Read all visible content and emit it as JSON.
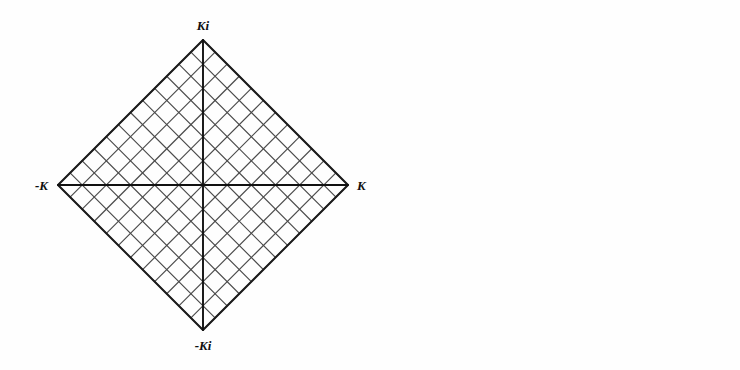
{
  "figure": {
    "background_color": "#fefefe",
    "ink_color": "#1c1c1c",
    "grid_color": "#4a4a4a"
  },
  "panels": [
    {
      "id": "square",
      "name": "square-domain",
      "shape": "square-rotated-45",
      "center": {
        "x": 203,
        "y": 185
      },
      "half_diagonal": 145,
      "grid_divisions_per_half_axis": 6,
      "grid_total_cells": "12 x 12",
      "labels": {
        "right": {
          "text": "K",
          "x": 357,
          "y": 190,
          "anchor": "start",
          "style": "italic"
        },
        "left": {
          "text": "-K",
          "x": 48,
          "y": 190,
          "anchor": "end",
          "style": "italic"
        },
        "top": {
          "text": "Ki",
          "x": 203,
          "y": 30,
          "anchor": "middle",
          "style": "italic"
        },
        "bottom": {
          "text": "-Ki",
          "x": 203,
          "y": 350,
          "anchor": "middle",
          "style": "italic"
        }
      }
    },
    {
      "id": "disk",
      "name": "disk-image",
      "shape": "circle",
      "center": {
        "x": 194,
        "y": 188
      },
      "radius": 134,
      "grid_divisions_per_half_axis": 6,
      "labels": {
        "right": {
          "text": "1",
          "x": 336,
          "y": 193,
          "anchor": "start",
          "style": "upright"
        },
        "left": {
          "text": "-1",
          "x": 52,
          "y": 193,
          "anchor": "end",
          "style": "upright"
        },
        "top": {
          "text": "i",
          "x": 194,
          "y": 36,
          "anchor": "middle",
          "style": "italic"
        },
        "bottom": {
          "text": "-i",
          "x": 194,
          "y": 350,
          "anchor": "middle",
          "style": "italic"
        }
      }
    }
  ],
  "chart_data": {
    "type": "line",
    "mapping": "w -> sn(w, k) with modulus k = 1/sqrt(2) (lemniscatic case)",
    "xlabel": "",
    "ylabel": "",
    "grid": true,
    "legend": false,
    "series": [
      {
        "name": "square-boundary",
        "panel": "square",
        "points": [
          [
            1,
            0
          ],
          [
            0,
            1
          ],
          [
            -1,
            0
          ],
          [
            0,
            -1
          ],
          [
            1,
            0
          ]
        ],
        "note": "unit-scaled diamond vertices at K, Ki, -K, -Ki"
      },
      {
        "name": "square-grid-u-lines",
        "panel": "square",
        "levels": [
          -1.0,
          -0.8333,
          -0.6667,
          -0.5,
          -0.3333,
          -0.1667,
          0,
          0.1667,
          0.3333,
          0.5,
          0.6667,
          0.8333,
          1.0
        ],
        "note": "lines of constant u (normalized), spanning the square"
      },
      {
        "name": "square-grid-v-lines",
        "panel": "square",
        "levels": [
          -1.0,
          -0.8333,
          -0.6667,
          -0.5,
          -0.3333,
          -0.1667,
          0,
          0.1667,
          0.3333,
          0.5,
          0.6667,
          0.8333,
          1.0
        ],
        "note": "lines of constant v (normalized), spanning the square"
      },
      {
        "name": "square-axes",
        "panel": "square",
        "points": [
          [
            -1,
            0
          ],
          [
            1,
            0
          ],
          [
            0,
            -1
          ],
          [
            0,
            1
          ]
        ],
        "note": "bold real and imaginary axes"
      },
      {
        "name": "disk-boundary",
        "panel": "disk",
        "radius": 1.0,
        "note": "unit circle"
      },
      {
        "name": "disk-grid-u-images",
        "panel": "disk",
        "levels": [
          -1.0,
          -0.8333,
          -0.6667,
          -0.5,
          -0.3333,
          -0.1667,
          0,
          0.1667,
          0.3333,
          0.5,
          0.6667,
          0.8333,
          1.0
        ],
        "note": "images of the constant-u lines; curves terminating on the circle"
      },
      {
        "name": "disk-grid-v-images",
        "panel": "disk",
        "levels": [
          -1.0,
          -0.8333,
          -0.6667,
          -0.5,
          -0.3333,
          -0.1667,
          0,
          0.1667,
          0.3333,
          0.5,
          0.6667,
          0.8333,
          1.0
        ],
        "note": "images of the constant-v lines; curves terminating on the circle"
      },
      {
        "name": "disk-axes",
        "panel": "disk",
        "points": [
          [
            -1,
            0
          ],
          [
            1,
            0
          ],
          [
            0,
            -1
          ],
          [
            0,
            1
          ]
        ],
        "note": "bold real and imaginary diameters"
      }
    ],
    "marked_points": [
      {
        "square_label": "K",
        "square_xy": [
          1,
          0
        ],
        "disk_label": "1",
        "disk_xy": [
          1,
          0
        ]
      },
      {
        "square_label": "Ki",
        "square_xy": [
          0,
          1
        ],
        "disk_label": "i",
        "disk_xy": [
          0,
          1
        ]
      },
      {
        "square_label": "-K",
        "square_xy": [
          -1,
          0
        ],
        "disk_label": "-1",
        "disk_xy": [
          -1,
          0
        ]
      },
      {
        "square_label": "-Ki",
        "square_xy": [
          0,
          -1
        ],
        "disk_label": "-i",
        "disk_xy": [
          0,
          -1
        ]
      }
    ]
  },
  "ghost_text": [
    {
      "text": "the conformal map of",
      "x": 60,
      "y": 60,
      "size": 15
    },
    {
      "text": "square onto circle",
      "x": 430,
      "y": 52,
      "size": 15
    },
    {
      "text": "FIGURE  elliptic",
      "x": 40,
      "y": 318,
      "size": 14
    },
    {
      "text": "functions of a complex",
      "x": 300,
      "y": 330,
      "size": 14
    }
  ]
}
